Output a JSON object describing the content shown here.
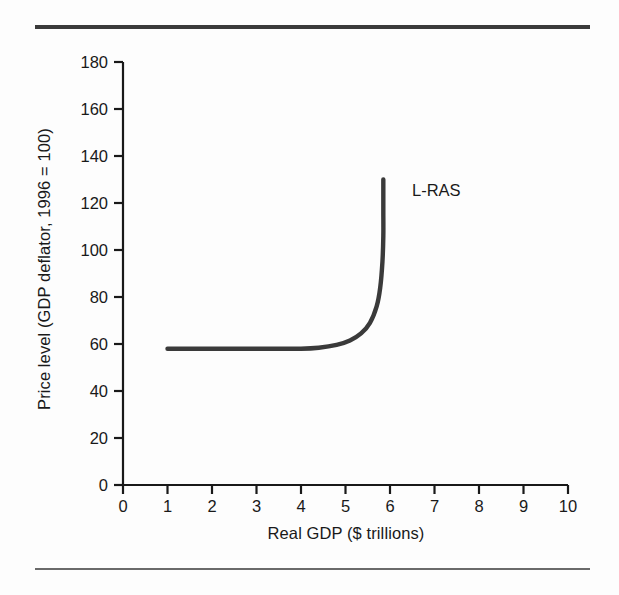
{
  "figure": {
    "background_color": "#fdfdfd",
    "rule_color": "#3b3b3b",
    "curve_color": "#3a3a3a",
    "text_color": "#191919"
  },
  "chart_data": {
    "type": "line",
    "title": "",
    "xlabel": "Real GDP ($ trillions)",
    "ylabel": "Price level (GDP deflator, 1996 = 100)",
    "xlim": [
      0,
      10
    ],
    "ylim": [
      0,
      180
    ],
    "grid": false,
    "legend_position": "inline-annotation",
    "xticks": [
      0,
      1,
      2,
      3,
      4,
      5,
      6,
      7,
      8,
      9,
      10
    ],
    "xtick_labels": [
      "0",
      "1",
      "2",
      "3",
      "4",
      "5",
      "6",
      "7",
      "8",
      "9",
      "10"
    ],
    "yticks": [
      0,
      20,
      40,
      60,
      80,
      100,
      120,
      140,
      160,
      180
    ],
    "ytick_labels": [
      "0",
      "20",
      "40",
      "60",
      "80",
      "100",
      "120",
      "140",
      "160",
      "180"
    ],
    "annotations": [
      {
        "text": "L-RAS",
        "x": 6.45,
        "y": 131
      }
    ],
    "series": [
      {
        "name": "L-RAS",
        "comment": "Long-run aggregate supply: horizontal at price level 58 from GDP 1.0, bending vertically at potential GDP near 5.85",
        "x": [
          1.0,
          2.0,
          3.0,
          4.0,
          4.4,
          4.8,
          5.1,
          5.35,
          5.55,
          5.7,
          5.78,
          5.83,
          5.85,
          5.85,
          5.85,
          5.85
        ],
        "y": [
          58,
          58,
          58,
          58,
          58.4,
          59.6,
          61.5,
          64.5,
          69,
          76,
          84,
          95,
          106,
          116,
          124,
          130
        ]
      }
    ]
  }
}
